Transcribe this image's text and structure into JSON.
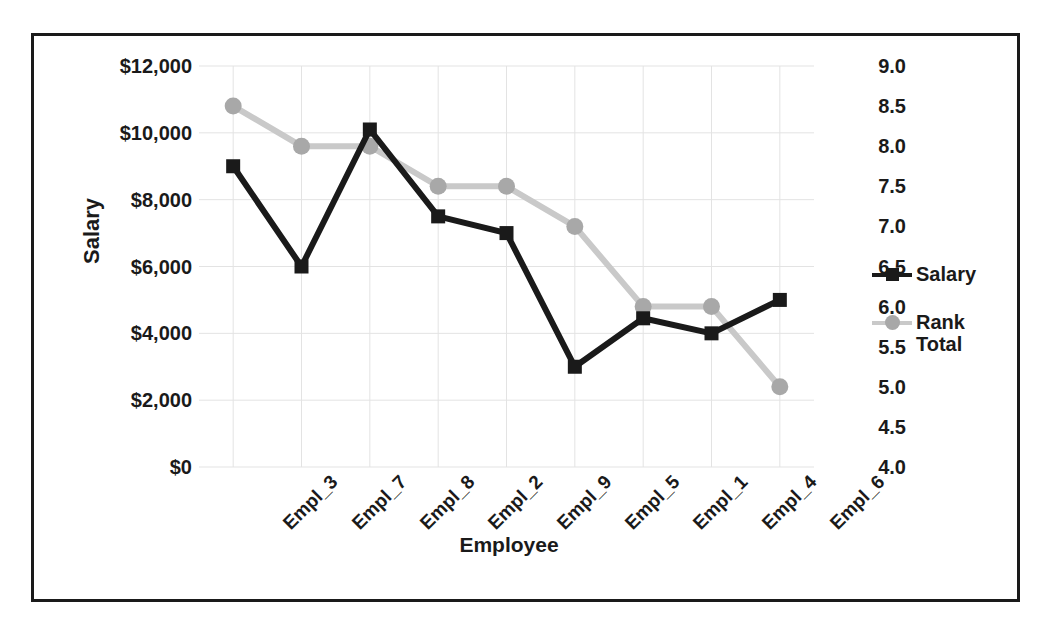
{
  "chart_data": {
    "type": "line",
    "title": "",
    "xlabel": "Employee",
    "ylabel": "Salary",
    "y2label": "",
    "categories": [
      "Empl_3",
      "Empl_7",
      "Empl_8",
      "Empl_2",
      "Empl_9",
      "Empl_5",
      "Empl_1",
      "Empl_4",
      "Empl_6"
    ],
    "series": [
      {
        "name": "Salary",
        "axis": "left",
        "color": "#1a1a1a",
        "marker": "square",
        "values": [
          9000,
          6000,
          10100,
          7500,
          7000,
          3000,
          4450,
          4000,
          5000
        ]
      },
      {
        "name": "Rank Total",
        "axis": "right",
        "color": "#c9c9c9",
        "marker": "circle",
        "values": [
          8.5,
          8.0,
          8.0,
          7.5,
          7.5,
          7.0,
          6.0,
          6.0,
          5.0
        ]
      }
    ],
    "ylim": [
      0,
      12000
    ],
    "ytick_labels": [
      "$12,000",
      "$10,000",
      "$8,000",
      "$6,000",
      "$4,000",
      "$2,000",
      "$0"
    ],
    "ytick_values": [
      12000,
      10000,
      8000,
      6000,
      4000,
      2000,
      0
    ],
    "y2lim": [
      4.0,
      9.0
    ],
    "y2tick_labels": [
      "9.0",
      "8.5",
      "8.0",
      "7.5",
      "7.0",
      "6.5",
      "6.0",
      "5.5",
      "5.0",
      "4.5",
      "4.0"
    ],
    "y2tick_values": [
      9.0,
      8.5,
      8.0,
      7.5,
      7.0,
      6.5,
      6.0,
      5.5,
      5.0,
      4.5,
      4.0
    ],
    "grid": true,
    "legend_position": "right",
    "legend": [
      {
        "label": "Salary",
        "color": "#1a1a1a",
        "marker": "square"
      },
      {
        "label": "Rank\nTotal",
        "label_line1": "Rank",
        "label_line2": "Total",
        "color": "#c9c9c9",
        "marker": "circle"
      }
    ]
  },
  "colors": {
    "salary": "#1a1a1a",
    "rank_total": "#c9c9c9",
    "gridline": "#e3e3e3",
    "border": "#1a1a1a",
    "background": "#ffffff"
  }
}
